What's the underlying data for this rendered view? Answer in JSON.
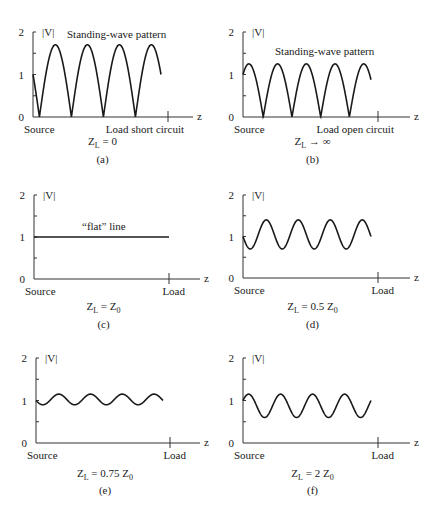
{
  "figure": {
    "panels": [
      {
        "id": "a",
        "label": "(a)",
        "caption_main": "Z",
        "caption_sub": "L",
        "caption_rest": " = 0",
        "annotation": "Standing-wave pattern",
        "ylabel": "|V|",
        "xlabel": "z",
        "left_label": "Source",
        "right_label": "Load short circuit",
        "yticks": [
          "0",
          "1",
          "2"
        ]
      },
      {
        "id": "b",
        "label": "(b)",
        "caption_main": "Z",
        "caption_sub": "L",
        "caption_rest": " → ∞",
        "annotation": "Standing-wave pattern",
        "ylabel": "|V|",
        "xlabel": "z",
        "left_label": "Source",
        "right_label": "Load open circuit",
        "yticks": [
          "0",
          "1",
          "2"
        ]
      },
      {
        "id": "c",
        "label": "(c)",
        "caption_main": "Z",
        "caption_sub": "L",
        "caption_rest": " = Z",
        "caption_sub2": "0",
        "annotation": "“flat” line",
        "ylabel": "|V|",
        "xlabel": "z",
        "left_label": "Source",
        "right_label": "Load",
        "yticks": [
          "0",
          "1",
          "2"
        ]
      },
      {
        "id": "d",
        "label": "(d)",
        "caption_main": "Z",
        "caption_sub": "L",
        "caption_rest": " = 0.5 Z",
        "caption_sub2": "0",
        "ylabel": "|V|",
        "xlabel": "z",
        "left_label": "Source",
        "right_label": "Load",
        "yticks": [
          "0",
          "1",
          "2"
        ]
      },
      {
        "id": "e",
        "label": "(e)",
        "caption_main": "Z",
        "caption_sub": "L",
        "caption_rest": " = 0.75 Z",
        "caption_sub2": "0",
        "ylabel": "|V|",
        "xlabel": "z",
        "left_label": "Source",
        "right_label": "Load",
        "yticks": [
          "0",
          "1",
          "2"
        ]
      },
      {
        "id": "f",
        "label": "(f)",
        "caption_main": "Z",
        "caption_sub": "L",
        "caption_rest": " = 2 Z",
        "caption_sub2": "0",
        "ylabel": "|V|",
        "xlabel": "z",
        "left_label": "Source",
        "right_label": "Load",
        "yticks": [
          "0",
          "1",
          "2"
        ]
      }
    ]
  },
  "chart_data": [
    {
      "type": "line",
      "title": "(a) Z_L = 0",
      "xlabel": "z",
      "ylabel": "|V|",
      "ylim": [
        0,
        2
      ],
      "description": "Rectified sine |V| with zeros; starts at 1 at Source, peaks ~1.7, four full lobes, ends at 0 at Load short circuit",
      "series": [
        {
          "name": "|V|",
          "min": 0,
          "max": 1.7,
          "start": 1.0,
          "end": 0,
          "lobes": 4
        }
      ]
    },
    {
      "type": "line",
      "title": "(b) Z_L → ∞",
      "xlabel": "z",
      "ylabel": "|V|",
      "ylim": [
        0,
        2
      ],
      "description": "Rectified sine |V|; starts at 1, peaks ~1.25, zeros at four minima, ends ~1.2 at Load open circuit",
      "series": [
        {
          "name": "|V|",
          "min": 0,
          "max": 1.25,
          "start": 1.0,
          "end": 1.2,
          "lobes": 4
        }
      ]
    },
    {
      "type": "line",
      "title": "(c) Z_L = Z_0",
      "xlabel": "z",
      "ylabel": "|V|",
      "ylim": [
        0,
        2
      ],
      "description": "Flat line at |V| = 1",
      "series": [
        {
          "name": "|V|",
          "min": 1,
          "max": 1,
          "start": 1,
          "end": 1
        }
      ]
    },
    {
      "type": "line",
      "title": "(d) Z_L = 0.5 Z_0",
      "xlabel": "z",
      "ylabel": "|V|",
      "ylim": [
        0,
        2
      ],
      "description": "Sinusoidal |V| oscillating between ~0.7 and ~1.4, four periods; starts at 1, ends ~0.7",
      "series": [
        {
          "name": "|V|",
          "min": 0.7,
          "max": 1.4,
          "start": 1.0,
          "end": 0.7,
          "periods": 4
        }
      ]
    },
    {
      "type": "line",
      "title": "(e) Z_L = 0.75 Z_0",
      "xlabel": "z",
      "ylabel": "|V|",
      "ylim": [
        0,
        2
      ],
      "description": "Sinusoidal |V| oscillating between ~0.9 and ~1.15, four periods",
      "series": [
        {
          "name": "|V|",
          "min": 0.9,
          "max": 1.15,
          "start": 1.0,
          "end": 0.9,
          "periods": 4
        }
      ]
    },
    {
      "type": "line",
      "title": "(f) Z_L = 2 Z_0",
      "xlabel": "z",
      "ylabel": "|V|",
      "ylim": [
        0,
        2
      ],
      "description": "Sinusoidal |V| oscillating between ~0.6 and ~1.15, four periods; starts at 1, ends ~1.15",
      "series": [
        {
          "name": "|V|",
          "min": 0.6,
          "max": 1.15,
          "start": 1.0,
          "end": 1.15,
          "periods": 4
        }
      ]
    }
  ]
}
